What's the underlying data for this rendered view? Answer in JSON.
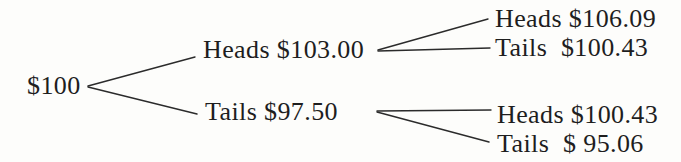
{
  "figure": {
    "type": "binomial-tree",
    "root": {
      "label": "$100"
    },
    "level1": [
      {
        "id": "heads",
        "label": "Heads $103.00"
      },
      {
        "id": "tails",
        "label": "Tails $97.50"
      }
    ],
    "level2": [
      {
        "id": "heads-heads",
        "label": "Heads $106.09"
      },
      {
        "id": "heads-tails",
        "label": "Tails  $100.43"
      },
      {
        "id": "tails-heads",
        "label": "Heads $100.43"
      },
      {
        "id": "tails-tails",
        "label": "Tails  $ 95.06"
      }
    ]
  },
  "colors": {
    "background": "#fdfdfb",
    "text": "#1e1e1e",
    "line": "#2b2b2b"
  }
}
